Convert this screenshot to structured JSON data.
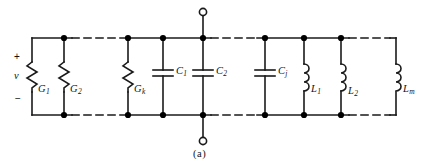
{
  "figure": {
    "caption": "(a)",
    "type": "electrical-schematic"
  },
  "port": {
    "plus_sign": "+",
    "minus_sign": "−",
    "voltage_label": "v",
    "top_terminal": "open-terminal-circle",
    "bottom_terminal": "open-terminal-circle"
  },
  "colors": {
    "wire": "#1a1a1a",
    "background": "#ffffff",
    "text": "#111111",
    "node": "#000000"
  },
  "components": [
    {
      "id": "G1",
      "kind": "resistor",
      "symbol": "zigzag",
      "letter": "G",
      "subscript": "1",
      "x": 32
    },
    {
      "id": "G2",
      "kind": "resistor",
      "symbol": "zigzag",
      "letter": "G",
      "subscript": "2",
      "x": 64
    },
    {
      "id": "Gk",
      "kind": "resistor",
      "symbol": "zigzag",
      "letter": "G",
      "subscript": "k",
      "x": 128
    },
    {
      "id": "C1",
      "kind": "capacitor",
      "symbol": "parallel-plates",
      "letter": "C",
      "subscript": "1",
      "x": 163
    },
    {
      "id": "C2",
      "kind": "capacitor",
      "symbol": "parallel-plates",
      "letter": "C",
      "subscript": "2",
      "x": 203
    },
    {
      "id": "Cj",
      "kind": "capacitor",
      "symbol": "parallel-plates",
      "letter": "C",
      "subscript": "j",
      "x": 265
    },
    {
      "id": "L1",
      "kind": "inductor",
      "symbol": "coil",
      "letter": "L",
      "subscript": "1",
      "x": 304
    },
    {
      "id": "L2",
      "kind": "inductor",
      "symbol": "coil",
      "letter": "L",
      "subscript": "2",
      "x": 341
    },
    {
      "id": "Lm",
      "kind": "inductor",
      "symbol": "coil",
      "letter": "L",
      "subscript": "m",
      "x": 396
    }
  ],
  "labels": {
    "G1": {
      "letter": "G",
      "subscript": "1"
    },
    "G2": {
      "letter": "G",
      "subscript": "2"
    },
    "Gk": {
      "letter": "G",
      "subscript": "k"
    },
    "C1": {
      "letter": "C",
      "subscript": "1"
    },
    "C2": {
      "letter": "C",
      "subscript": "2"
    },
    "Cj": {
      "letter": "C",
      "subscript": "j"
    },
    "L1": {
      "letter": "L",
      "subscript": "1"
    },
    "L2": {
      "letter": "L",
      "subscript": "2"
    },
    "Lm": {
      "letter": "L",
      "subscript": "m"
    }
  },
  "rails": {
    "top_y": 38,
    "bottom_y": 115,
    "left_x": 32,
    "right_x": 396,
    "dashed_segments_top": [
      [
        72,
        120
      ],
      [
        211,
        257
      ],
      [
        349,
        388
      ]
    ],
    "dashed_segments_bottom": [
      [
        72,
        120
      ],
      [
        211,
        257
      ],
      [
        349,
        388
      ]
    ]
  },
  "nodes_top": [
    64,
    128,
    163,
    203,
    265,
    304,
    341
  ],
  "nodes_bottom": [
    64,
    128,
    163,
    203,
    265,
    304,
    341
  ]
}
